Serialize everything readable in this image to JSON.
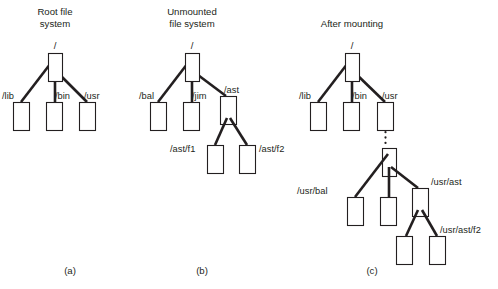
{
  "figure": {
    "type": "diagram",
    "background_color": "#ffffff",
    "line_color": "#231f20"
  },
  "panels": [
    {
      "id": "a",
      "caption": "(a)",
      "title_lines": [
        "Root file",
        "system"
      ],
      "root_label": "/",
      "nodes": [
        {
          "name": "root",
          "label": "/",
          "label_position": "above"
        },
        {
          "name": "lib",
          "label": "/lib",
          "label_position": "left"
        },
        {
          "name": "bin",
          "label": "/bin",
          "label_position": "left"
        },
        {
          "name": "usr",
          "label": "/usr",
          "label_position": "right"
        }
      ]
    },
    {
      "id": "b",
      "caption": "(b)",
      "title_lines": [
        "Unmounted",
        "file system"
      ],
      "root_label": "/",
      "nodes": [
        {
          "name": "root",
          "label": "/",
          "label_position": "above"
        },
        {
          "name": "bal",
          "label": "/bal",
          "label_position": "left"
        },
        {
          "name": "jim",
          "label": "/jim",
          "label_position": "left"
        },
        {
          "name": "ast",
          "label": "/ast",
          "label_position": "right"
        },
        {
          "name": "ast-f1",
          "label": "/ast/f1",
          "label_position": "left"
        },
        {
          "name": "ast-f2",
          "label": "/ast/f2",
          "label_position": "right"
        }
      ]
    },
    {
      "id": "c",
      "caption": "(c)",
      "title_lines": [
        "After mounting"
      ],
      "root_label": "/",
      "nodes": [
        {
          "name": "root",
          "label": "/",
          "label_position": "above"
        },
        {
          "name": "lib",
          "label": "/lib",
          "label_position": "left"
        },
        {
          "name": "bin",
          "label": "/bin",
          "label_position": "left"
        },
        {
          "name": "usr",
          "label": "/usr",
          "label_position": "right"
        },
        {
          "name": "usr-bal",
          "label": "/usr/bal",
          "label_position": "left"
        },
        {
          "name": "usr-jim",
          "label": "",
          "label_position": "none"
        },
        {
          "name": "usr-ast",
          "label": "/usr/ast",
          "label_position": "right"
        },
        {
          "name": "usr-ast-f1",
          "label": "",
          "label_position": "none"
        },
        {
          "name": "usr-ast-f2",
          "label": "/usr/ast/f2",
          "label_position": "right"
        }
      ],
      "mount_link": "dotted"
    }
  ],
  "labels": {
    "a_title_line1": "Root file",
    "a_title_line2": "system",
    "a_root": "/",
    "a_lib": "/lib",
    "a_bin": "/bin",
    "a_usr": "/usr",
    "a_caption": "(a)",
    "b_title_line1": "Unmounted",
    "b_title_line2": "file system",
    "b_root": "/",
    "b_bal": "/bal",
    "b_jim": "/jim",
    "b_ast": "/ast",
    "b_ast_f1": "/ast/f1",
    "b_ast_f2": "/ast/f2",
    "b_caption": "(b)",
    "c_title_line1": "After mounting",
    "c_root": "/",
    "c_lib": "/lib",
    "c_bin": "/bin",
    "c_usr": "/usr",
    "c_usr_bal": "/usr/bal",
    "c_usr_ast": "/usr/ast",
    "c_usr_ast_f2": "/usr/ast/f2",
    "c_caption": "(c)"
  }
}
